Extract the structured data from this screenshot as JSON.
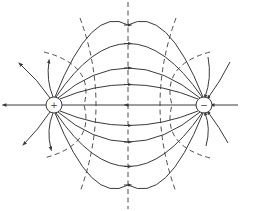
{
  "diagram": {
    "type": "electric-dipole-field-lines",
    "charges": [
      {
        "id": "positive",
        "symbol": "+",
        "cx": 54,
        "cy": 105,
        "r": 8
      },
      {
        "id": "negative",
        "symbol": "−",
        "cx": 204,
        "cy": 105,
        "r": 8
      }
    ],
    "colors": {
      "line": "#3a3a3a",
      "background": "#ffffff"
    },
    "legend": {
      "solid": "field lines",
      "dashed": "equipotential lines"
    }
  }
}
